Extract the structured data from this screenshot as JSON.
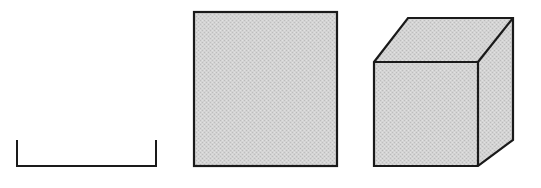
{
  "figure": {
    "width": 541,
    "height": 188,
    "background_color": "#ffffff",
    "stroke_color": "#1a1a1a",
    "fill_color": "#d2d2d2",
    "fill_texture": "dithered-halftone-gray",
    "shapes": [
      {
        "id": "bracket",
        "name": "open-bracket-shape",
        "label": "",
        "type": "open-polyline",
        "description": "U-shaped open bracket formed by two short vertical strokes joined by a horizontal baseline",
        "stroke_width": 2,
        "filled": false,
        "points": [
          [
            17,
            140
          ],
          [
            17,
            166
          ],
          [
            156,
            166
          ],
          [
            156,
            140
          ]
        ]
      },
      {
        "id": "square",
        "name": "filled-square-shape",
        "label": "",
        "type": "rectangle",
        "description": "Solid gray-filled square with dark outline",
        "stroke_width": 2,
        "filled": true,
        "x": 194,
        "y": 12,
        "width": 143,
        "height": 154
      },
      {
        "id": "cube",
        "name": "cube-shape",
        "label": "",
        "type": "cube-oblique",
        "description": "Gray-filled cube drawn in oblique projection showing front face, top face and right face",
        "stroke_width": 2,
        "filled": true,
        "front_face": [
          [
            374,
            62
          ],
          [
            478,
            62
          ],
          [
            478,
            166
          ],
          [
            374,
            166
          ]
        ],
        "top_face": [
          [
            374,
            62
          ],
          [
            408,
            18
          ],
          [
            513,
            18
          ],
          [
            478,
            62
          ]
        ],
        "right_face": [
          [
            478,
            62
          ],
          [
            513,
            18
          ],
          [
            513,
            140
          ],
          [
            478,
            166
          ]
        ],
        "depth_offset_x": 35,
        "depth_offset_y": -44
      }
    ]
  }
}
